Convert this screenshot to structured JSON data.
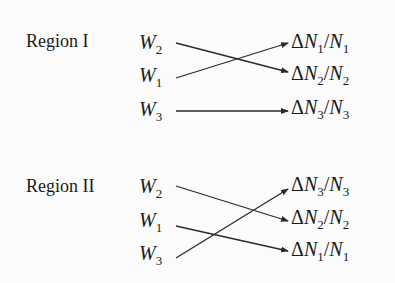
{
  "regions": [
    {
      "label": "Region I",
      "sources": [
        {
          "var": "W",
          "sub": "2"
        },
        {
          "var": "W",
          "sub": "1"
        },
        {
          "var": "W",
          "sub": "3"
        }
      ],
      "targets": [
        {
          "prefix": "Δ",
          "var": "N",
          "sub": "1",
          "den": "N",
          "den_sub": "1"
        },
        {
          "prefix": "Δ",
          "var": "N",
          "sub": "2",
          "den": "N",
          "den_sub": "2"
        },
        {
          "prefix": "Δ",
          "var": "N",
          "sub": "3",
          "den": "N",
          "den_sub": "3"
        }
      ],
      "arrows": [
        {
          "from": "W2",
          "to": "ΔN2/N2"
        },
        {
          "from": "W1",
          "to": "ΔN1/N1"
        },
        {
          "from": "W3",
          "to": "ΔN3/N3"
        }
      ]
    },
    {
      "label": "Region II",
      "sources": [
        {
          "var": "W",
          "sub": "2"
        },
        {
          "var": "W",
          "sub": "1"
        },
        {
          "var": "W",
          "sub": "3"
        }
      ],
      "targets": [
        {
          "prefix": "Δ",
          "var": "N",
          "sub": "3",
          "den": "N",
          "den_sub": "3"
        },
        {
          "prefix": "Δ",
          "var": "N",
          "sub": "2",
          "den": "N",
          "den_sub": "2"
        },
        {
          "prefix": "Δ",
          "var": "N",
          "sub": "1",
          "den": "N",
          "den_sub": "1"
        }
      ],
      "arrows": [
        {
          "from": "W2",
          "to": "ΔN2/N2"
        },
        {
          "from": "W1",
          "to": "ΔN1/N1"
        },
        {
          "from": "W3",
          "to": "ΔN3/N3"
        }
      ]
    }
  ],
  "colors": {
    "line": "#2a2a2a",
    "text": "#1a1a1a",
    "background": "#fbfbfb"
  }
}
